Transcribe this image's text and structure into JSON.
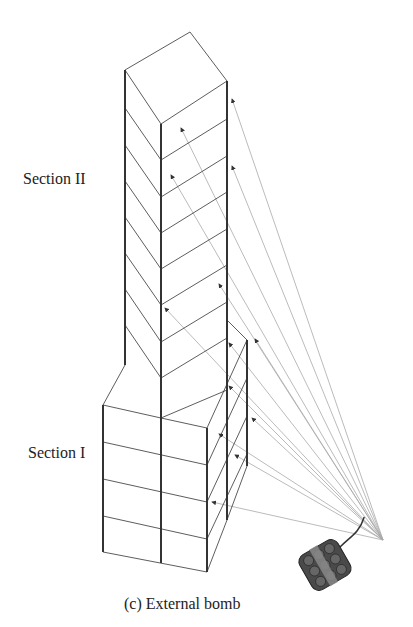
{
  "labels": {
    "section2": "Section II",
    "section1": "Section I",
    "caption": "(c)  External bomb"
  },
  "colors": {
    "structure": "#333333",
    "rays": "#aaaaaa",
    "bomb": "#444444",
    "band": "#888888"
  }
}
